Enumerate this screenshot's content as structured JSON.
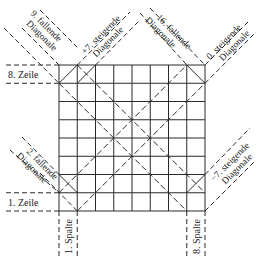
{
  "diagram": {
    "grid_size": 8,
    "colors": {
      "line": "#2a2a2a",
      "background": "#ffffff",
      "text": "#222222"
    },
    "rows": {
      "top_label": "8. Zeile",
      "bottom_label": "1. Zeile"
    },
    "columns": {
      "left_label": "1. Spalte",
      "right_label": "8. Spalte"
    },
    "diagonals": {
      "top_left_falling": {
        "line1": "9. fallende",
        "line2": "Diagonale"
      },
      "top_mid_rising": {
        "line1": "+7. steigende",
        "line2": "Diagonale"
      },
      "top_right_falling": {
        "line1": "16. fallende",
        "line2": "Diagonale"
      },
      "top_right_rising": {
        "line1": "0. steigende",
        "line2": "Diagonale"
      },
      "bottom_left_falling": {
        "line1": "2. fallende",
        "line2": "Diagonale"
      },
      "bottom_right_rising": {
        "line1": "−7. steigende",
        "line2": "Diagonale"
      }
    }
  }
}
